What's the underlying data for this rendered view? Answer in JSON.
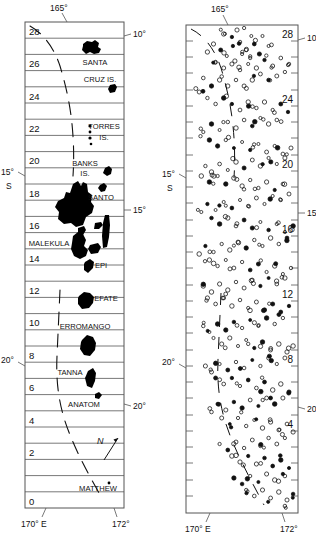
{
  "figure": {
    "type": "map-pair",
    "caption_absent": true,
    "panels": [
      {
        "id": "left",
        "name": "island-map",
        "frame": {
          "x": 25,
          "y": 22,
          "w": 99,
          "h": 486
        },
        "row_count": 30,
        "row_labels": [
          "28",
          "26",
          "24",
          "22",
          "20",
          "18",
          "16",
          "14",
          "12",
          "10",
          "8",
          "6",
          "4",
          "2",
          "0"
        ],
        "row_label_rows": [
          28,
          26,
          24,
          22,
          20,
          18,
          16,
          14,
          12,
          10,
          8,
          6,
          4,
          2,
          0
        ],
        "axis_labels": {
          "top": "165°",
          "bottom_left": "170° E",
          "bottom_right": "172°",
          "right_upper": "10°",
          "right_mid": "15°",
          "right_lower": "20°",
          "left_upper": "15°",
          "left_upper_2": "S",
          "left_lower": "20°"
        },
        "island_labels": [
          {
            "text": "SANTA",
            "x": 95,
            "y": 62
          },
          {
            "text": "CRUZ IS.",
            "x": 100,
            "y": 79
          },
          {
            "text": "TORRES",
            "x": 100,
            "y": 128
          },
          {
            "text": "IS.",
            "x": 96,
            "y": 139
          },
          {
            "text": "BANKS",
            "x": 82,
            "y": 165
          },
          {
            "text": "IS.",
            "x": 80,
            "y": 174
          },
          {
            "text": "SANTO",
            "x": 95,
            "y": 203
          },
          {
            "text": "MALEKULA",
            "x": 49,
            "y": 245
          },
          {
            "text": "EPI",
            "x": 99,
            "y": 268
          },
          {
            "text": "EFATE",
            "x": 100,
            "y": 303
          },
          {
            "text": "ERROMANGO",
            "x": 90,
            "y": 332
          },
          {
            "text": "TANNA",
            "x": 76,
            "y": 378
          },
          {
            "text": "ANATOM",
            "x": 90,
            "y": 406
          },
          {
            "text": "MATTHEW",
            "x": 99,
            "y": 491
          }
        ],
        "north_arrow": {
          "label": "N",
          "x": 100,
          "y": 443
        }
      },
      {
        "id": "right",
        "name": "epicenter-map",
        "frame": {
          "x": 186,
          "y": 25,
          "w": 112,
          "h": 488
        },
        "row_labels": [
          "28",
          "24",
          "20",
          "16",
          "12",
          "8",
          "4"
        ],
        "row_label_rows": [
          28,
          24,
          20,
          16,
          12,
          8,
          4
        ],
        "axis_labels": {
          "top": "165°",
          "bottom_left": "170° E",
          "bottom_right": "172°",
          "right_upper": "10°",
          "right_mid": "15°",
          "right_lower": "20°",
          "left_upper": "15°",
          "left_upper_2": "S",
          "left_lower": "20°"
        },
        "symbol": "open-circle",
        "event_count_approx": 560
      }
    ],
    "colors": {
      "ink": "#111111",
      "frame": "#555555",
      "land": "#000000"
    }
  },
  "chart_data": {
    "type": "scatter",
    "title": "",
    "xlabel": "Longitude",
    "ylabel": "Latitude",
    "xlim": [
      164.0,
      172.5
    ],
    "ylim": [
      -23.0,
      -9.0
    ],
    "grid": false,
    "legend": null,
    "series": [
      {
        "name": "epicenters",
        "marker": "open-circle",
        "points": [
          [
            30,
            20
          ],
          [
            41,
            17
          ],
          [
            49,
            24
          ],
          [
            36,
            28
          ],
          [
            44,
            31
          ],
          [
            56,
            22
          ],
          [
            63,
            30
          ],
          [
            52,
            36
          ],
          [
            45,
            40
          ],
          [
            58,
            44
          ],
          [
            66,
            38
          ],
          [
            74,
            30
          ],
          [
            80,
            40
          ],
          [
            71,
            48
          ],
          [
            62,
            52
          ],
          [
            54,
            48
          ],
          [
            47,
            55
          ],
          [
            39,
            50
          ],
          [
            33,
            44
          ],
          [
            26,
            38
          ],
          [
            20,
            46
          ],
          [
            28,
            56
          ],
          [
            36,
            62
          ],
          [
            44,
            58
          ],
          [
            52,
            64
          ],
          [
            60,
            58
          ],
          [
            68,
            62
          ],
          [
            76,
            54
          ],
          [
            84,
            60
          ],
          [
            92,
            52
          ],
          [
            100,
            58
          ],
          [
            96,
            66
          ],
          [
            88,
            70
          ],
          [
            80,
            74
          ],
          [
            72,
            68
          ],
          [
            64,
            74
          ],
          [
            56,
            80
          ],
          [
            48,
            74
          ],
          [
            40,
            80
          ],
          [
            32,
            74
          ],
          [
            24,
            80
          ],
          [
            16,
            72
          ],
          [
            12,
            86
          ],
          [
            20,
            92
          ],
          [
            28,
            98
          ],
          [
            36,
            92
          ],
          [
            44,
            98
          ],
          [
            52,
            104
          ],
          [
            60,
            96
          ],
          [
            68,
            102
          ],
          [
            76,
            96
          ],
          [
            84,
            104
          ],
          [
            92,
            98
          ],
          [
            99,
            106
          ],
          [
            88,
            114
          ],
          [
            80,
            118
          ],
          [
            72,
            112
          ],
          [
            64,
            120
          ],
          [
            56,
            114
          ],
          [
            48,
            122
          ],
          [
            40,
            116
          ],
          [
            32,
            124
          ],
          [
            24,
            118
          ],
          [
            16,
            126
          ],
          [
            22,
            134
          ],
          [
            30,
            140
          ],
          [
            38,
            134
          ],
          [
            46,
            142
          ],
          [
            54,
            136
          ],
          [
            62,
            144
          ],
          [
            70,
            138
          ],
          [
            78,
            146
          ],
          [
            86,
            140
          ],
          [
            94,
            148
          ],
          [
            102,
            142
          ],
          [
            96,
            152
          ],
          [
            88,
            158
          ],
          [
            80,
            152
          ],
          [
            72,
            160
          ],
          [
            64,
            154
          ],
          [
            56,
            162
          ],
          [
            48,
            156
          ],
          [
            40,
            164
          ],
          [
            32,
            158
          ],
          [
            24,
            166
          ],
          [
            18,
            160
          ],
          [
            14,
            170
          ],
          [
            22,
            176
          ],
          [
            30,
            170
          ],
          [
            38,
            178
          ],
          [
            46,
            172
          ],
          [
            54,
            180
          ],
          [
            62,
            174
          ],
          [
            70,
            182
          ],
          [
            78,
            176
          ],
          [
            86,
            184
          ],
          [
            94,
            178
          ],
          [
            100,
            188
          ],
          [
            92,
            194
          ],
          [
            84,
            190
          ],
          [
            76,
            198
          ],
          [
            68,
            192
          ],
          [
            60,
            200
          ],
          [
            52,
            194
          ],
          [
            44,
            202
          ],
          [
            36,
            196
          ],
          [
            28,
            204
          ],
          [
            20,
            198
          ],
          [
            14,
            206
          ],
          [
            24,
            212
          ],
          [
            32,
            218
          ],
          [
            40,
            212
          ],
          [
            48,
            220
          ],
          [
            56,
            214
          ],
          [
            64,
            222
          ],
          [
            72,
            216
          ],
          [
            80,
            224
          ],
          [
            88,
            218
          ],
          [
            96,
            226
          ],
          [
            104,
            220
          ],
          [
            98,
            232
          ],
          [
            90,
            238
          ],
          [
            82,
            232
          ],
          [
            74,
            240
          ],
          [
            66,
            234
          ],
          [
            58,
            242
          ],
          [
            50,
            236
          ],
          [
            42,
            244
          ],
          [
            34,
            238
          ],
          [
            26,
            246
          ],
          [
            18,
            240
          ],
          [
            12,
            248
          ],
          [
            22,
            254
          ],
          [
            30,
            260
          ],
          [
            38,
            254
          ],
          [
            46,
            262
          ],
          [
            54,
            256
          ],
          [
            62,
            264
          ],
          [
            70,
            258
          ],
          [
            78,
            266
          ],
          [
            86,
            260
          ],
          [
            94,
            268
          ],
          [
            102,
            262
          ],
          [
            96,
            272
          ],
          [
            88,
            278
          ],
          [
            80,
            272
          ],
          [
            72,
            280
          ],
          [
            64,
            274
          ],
          [
            56,
            282
          ],
          [
            48,
            276
          ],
          [
            40,
            284
          ],
          [
            32,
            278
          ],
          [
            24,
            286
          ],
          [
            16,
            280
          ],
          [
            20,
            292
          ],
          [
            28,
            298
          ],
          [
            36,
            292
          ],
          [
            44,
            300
          ],
          [
            52,
            294
          ],
          [
            60,
            302
          ],
          [
            68,
            296
          ],
          [
            76,
            304
          ],
          [
            84,
            298
          ],
          [
            92,
            306
          ],
          [
            100,
            300
          ],
          [
            94,
            312
          ],
          [
            86,
            318
          ],
          [
            78,
            312
          ],
          [
            70,
            320
          ],
          [
            62,
            314
          ],
          [
            54,
            322
          ],
          [
            46,
            316
          ],
          [
            38,
            324
          ],
          [
            30,
            318
          ],
          [
            22,
            326
          ],
          [
            16,
            320
          ],
          [
            26,
            332
          ],
          [
            34,
            338
          ],
          [
            42,
            332
          ],
          [
            50,
            340
          ],
          [
            58,
            334
          ],
          [
            66,
            342
          ],
          [
            74,
            336
          ],
          [
            82,
            344
          ],
          [
            90,
            338
          ],
          [
            98,
            346
          ],
          [
            104,
            340
          ],
          [
            96,
            352
          ],
          [
            88,
            358
          ],
          [
            80,
            352
          ],
          [
            72,
            360
          ],
          [
            64,
            354
          ],
          [
            56,
            362
          ],
          [
            48,
            356
          ],
          [
            40,
            364
          ],
          [
            32,
            358
          ],
          [
            24,
            366
          ],
          [
            18,
            360
          ],
          [
            28,
            372
          ],
          [
            36,
            378
          ],
          [
            44,
            372
          ],
          [
            52,
            380
          ],
          [
            60,
            374
          ],
          [
            68,
            382
          ],
          [
            76,
            376
          ],
          [
            84,
            384
          ],
          [
            92,
            378
          ],
          [
            100,
            386
          ],
          [
            94,
            392
          ],
          [
            86,
            398
          ],
          [
            78,
            392
          ],
          [
            70,
            400
          ],
          [
            62,
            394
          ],
          [
            54,
            402
          ],
          [
            46,
            396
          ],
          [
            38,
            404
          ],
          [
            30,
            398
          ],
          [
            24,
            406
          ],
          [
            34,
            412
          ],
          [
            42,
            418
          ],
          [
            50,
            412
          ],
          [
            58,
            420
          ],
          [
            66,
            414
          ],
          [
            74,
            422
          ],
          [
            82,
            416
          ],
          [
            90,
            424
          ],
          [
            98,
            418
          ],
          [
            104,
            426
          ],
          [
            96,
            432
          ],
          [
            88,
            438
          ],
          [
            80,
            432
          ],
          [
            72,
            440
          ],
          [
            64,
            434
          ],
          [
            56,
            442
          ],
          [
            48,
            436
          ],
          [
            40,
            444
          ],
          [
            32,
            438
          ],
          [
            44,
            450
          ],
          [
            52,
            456
          ],
          [
            60,
            450
          ],
          [
            68,
            458
          ],
          [
            76,
            452
          ],
          [
            84,
            460
          ],
          [
            92,
            454
          ],
          [
            100,
            462
          ],
          [
            94,
            468
          ],
          [
            86,
            474
          ],
          [
            78,
            468
          ],
          [
            70,
            476
          ],
          [
            62,
            470
          ],
          [
            54,
            478
          ],
          [
            46,
            472
          ],
          [
            58,
            484
          ],
          [
            66,
            490
          ],
          [
            74,
            484
          ],
          [
            82,
            492
          ],
          [
            90,
            486
          ],
          [
            98,
            494
          ],
          [
            104,
            488
          ],
          [
            96,
            500
          ]
        ]
      }
    ]
  }
}
